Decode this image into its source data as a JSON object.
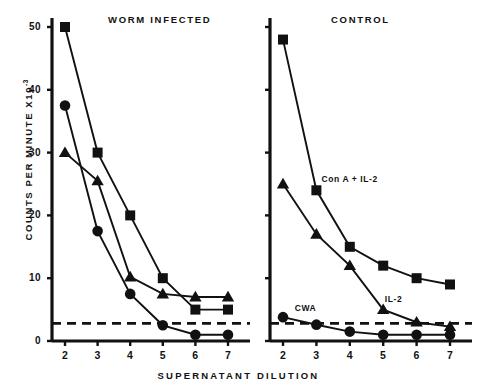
{
  "axis": {
    "ylabel_text": "COUNTS PER MINUTE X10",
    "ylabel_exp": "-3",
    "xlabel": "SUPERNATANT  DILUTION",
    "yticks": [
      "0",
      "10",
      "20",
      "30",
      "40",
      "50"
    ],
    "xticks": [
      "2",
      "3",
      "4",
      "5",
      "6",
      "7"
    ]
  },
  "panels": {
    "left": {
      "title": "WORM INFECTED",
      "series_labels": []
    },
    "right": {
      "title": "CONTROL",
      "series_labels": [
        "Con A + IL-2",
        "IL-2",
        "CWA"
      ]
    }
  },
  "chart_data": [
    {
      "type": "line",
      "title": "WORM INFECTED",
      "xlabel": "SUPERNATANT DILUTION",
      "ylabel": "COUNTS PER MINUTE X10-3",
      "x": [
        2,
        3,
        4,
        5,
        6,
        7
      ],
      "xlim": [
        1.6,
        7.5
      ],
      "ylim": [
        0,
        52
      ],
      "grid": false,
      "legend": "none",
      "threshold_line": 2.8,
      "series": [
        {
          "name": "Con A + IL-2",
          "marker": "square",
          "values": [
            50,
            30,
            20,
            10,
            5,
            5
          ]
        },
        {
          "name": "IL-2",
          "marker": "triangle",
          "values": [
            30,
            25.5,
            10.2,
            7.5,
            7,
            7
          ]
        },
        {
          "name": "CWA",
          "marker": "circle",
          "values": [
            37.5,
            17.5,
            7.5,
            2.5,
            1,
            1
          ]
        }
      ]
    },
    {
      "type": "line",
      "title": "CONTROL",
      "xlabel": "SUPERNATANT DILUTION",
      "ylabel": "COUNTS PER MINUTE X10-3",
      "x": [
        2,
        3,
        4,
        5,
        6,
        7
      ],
      "xlim": [
        1.6,
        7.5
      ],
      "ylim": [
        0,
        52
      ],
      "grid": false,
      "legend": "inline",
      "threshold_line": 2.8,
      "series": [
        {
          "name": "Con A + IL-2",
          "marker": "square",
          "values": [
            48,
            24,
            15,
            12,
            10,
            9
          ]
        },
        {
          "name": "IL-2",
          "marker": "triangle",
          "values": [
            25,
            17,
            12,
            5,
            3,
            2.3
          ]
        },
        {
          "name": "CWA",
          "marker": "circle",
          "values": [
            3.8,
            2.6,
            1.5,
            1,
            1,
            1
          ]
        }
      ]
    }
  ]
}
